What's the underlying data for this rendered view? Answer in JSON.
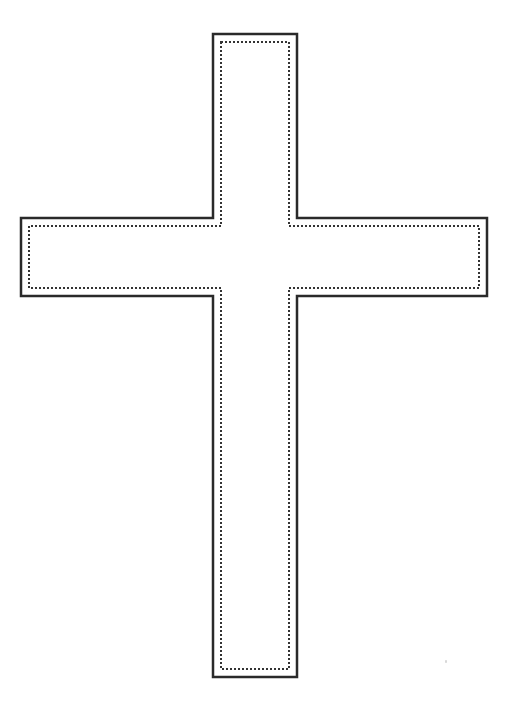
{
  "document": {
    "kind": "line-art-template",
    "subject": "latin-cross",
    "title": "Cross Outline Template",
    "background_color": "#ffffff",
    "canvas": {
      "width": 511,
      "height": 713
    }
  },
  "figure": {
    "name": "cross-shape",
    "outline": {
      "stroke_color": "#2a2a2a",
      "stroke_width": 2.5,
      "fill_color": "#ffffff",
      "style": "solid"
    },
    "inner_guide": {
      "stroke_color": "#333333",
      "stroke_width": 2,
      "style": "dotted",
      "dash_array": "2 2",
      "inset": 8
    },
    "geometry": {
      "vertical_beam": {
        "left": 213,
        "right": 297,
        "top": 34,
        "bottom": 677,
        "width": 84,
        "height": 643
      },
      "horizontal_beam": {
        "left": 21,
        "right": 487,
        "top": 218,
        "bottom": 296,
        "width": 466,
        "height": 78
      },
      "outline_points": "213,34 297,34 297,218 487,218 487,296 297,296 297,677 213,677 213,296 21,296 21,218 213,218",
      "inner_points": "221,42 289,42 289,226 479,226 479,288 289,288 289,669 221,669 221,288 29,288 29,226 221,226"
    }
  },
  "artifacts": [
    {
      "name": "dust-speck",
      "x": 445,
      "y": 660,
      "color": "#d8d8d8"
    }
  ]
}
